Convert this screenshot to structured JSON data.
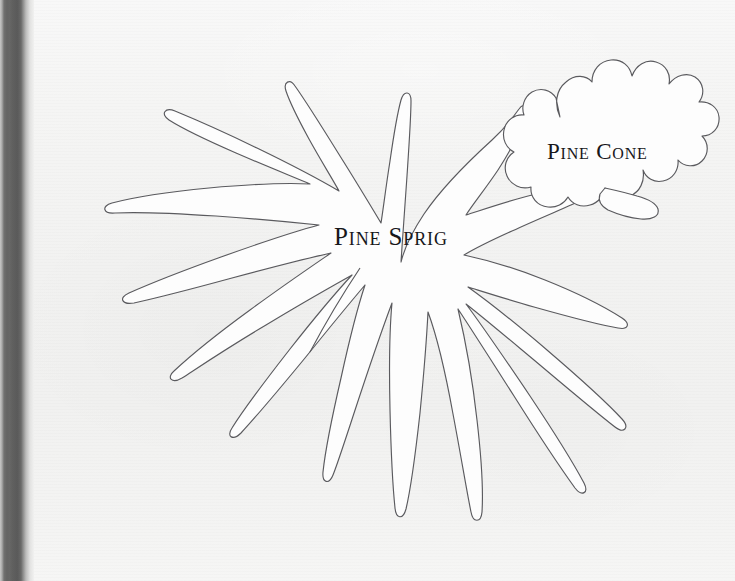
{
  "page": {
    "kind": "scanned-book-page",
    "width": 735,
    "height": 581,
    "paper_color": "#f2f2f1",
    "binding_color": "#5a5a59",
    "outline_color": "#5a5a5e",
    "shape_fill": "#fdfdfd"
  },
  "templates": [
    {
      "id": "pine-sprig",
      "label": "Pine Sprig",
      "label_x": 334,
      "label_y": 224
    },
    {
      "id": "pine-cone",
      "label": "Pine Cone",
      "label_x": 547,
      "label_y": 140
    }
  ]
}
